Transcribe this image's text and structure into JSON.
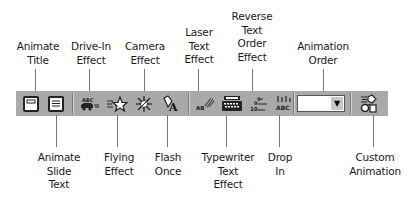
{
  "diagram": {
    "top_labels": [
      {
        "id": "animate-title",
        "text": "Animate\nTitle"
      },
      {
        "id": "drive-in-effect",
        "text": "Drive-In\nEffect"
      },
      {
        "id": "camera-effect",
        "text": "Camera\nEffect"
      },
      {
        "id": "laser-text-effect",
        "text": "Laser\nText\nEffect"
      },
      {
        "id": "reverse-text-order-effect",
        "text": "Reverse\nText\nOrder\nEffect"
      },
      {
        "id": "animation-order",
        "text": "Animation\nOrder"
      }
    ],
    "bottom_labels": [
      {
        "id": "animate-slide-text",
        "text": "Animate\nSlide\nText"
      },
      {
        "id": "flying-effect",
        "text": "Flying\nEffect"
      },
      {
        "id": "flash-once",
        "text": "Flash\nOnce"
      },
      {
        "id": "typewriter-text-effect",
        "text": "Typewriter\nText\nEffect"
      },
      {
        "id": "drop-in",
        "text": "Drop\nIn"
      },
      {
        "id": "custom-animation",
        "text": "Custom\nAnimation"
      }
    ]
  },
  "toolbar": {
    "buttons": [
      {
        "id": "animate-title",
        "icon": "animate-title-icon"
      },
      {
        "id": "animate-slide-text",
        "icon": "animate-slide-text-icon"
      },
      {
        "id": "drive-in-effect",
        "icon": "car-icon",
        "glyph": "ABC"
      },
      {
        "id": "flying-effect",
        "icon": "star-icon"
      },
      {
        "id": "camera-effect",
        "icon": "camera-burst-icon"
      },
      {
        "id": "flash-once",
        "icon": "flash-icon",
        "glyph": "A"
      },
      {
        "id": "laser-text-effect",
        "icon": "laser-icon",
        "glyph": "AB"
      },
      {
        "id": "typewriter-text-effect",
        "icon": "typewriter-icon"
      },
      {
        "id": "reverse-text-order-effect",
        "icon": "reverse-order-icon",
        "glyph": "10"
      },
      {
        "id": "drop-in",
        "icon": "drop-in-icon",
        "glyph": "ABC"
      },
      {
        "id": "custom-animation",
        "icon": "custom-animation-icon"
      }
    ],
    "animation_order": {
      "value": "",
      "arrow": "▼"
    }
  },
  "colors": {
    "toolbar_bg": "#a9a9a9",
    "leader_line": "#777777",
    "text": "#1a1a1a"
  }
}
